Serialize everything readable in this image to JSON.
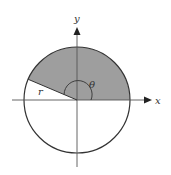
{
  "diagram": {
    "labels": {
      "x_axis": "x",
      "y_axis": "y",
      "radius": "r",
      "angle": "θ"
    },
    "circle": {
      "center": [
        77,
        100
      ],
      "radius": 53
    },
    "sector": {
      "start_angle_deg": 0,
      "end_angle_deg": 157,
      "fill": "#9e9e9e"
    },
    "colors": {
      "stroke": "#333333",
      "shade": "#9e9e9e",
      "background": "#ffffff"
    }
  }
}
